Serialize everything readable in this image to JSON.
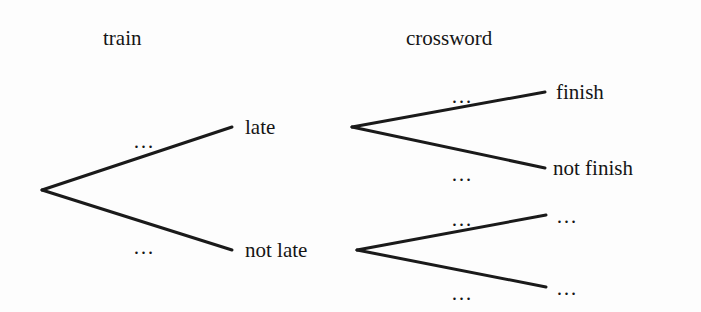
{
  "figure": {
    "kind": "probability-tree-diagram",
    "background_color": "#fdfdfd",
    "line_color": "#1a1a1a",
    "text_color": "#151515"
  },
  "columns": [
    {
      "id": "stage-1",
      "label": "train",
      "x": 103,
      "y": 28
    },
    {
      "id": "stage-2",
      "label": "crossword",
      "x": 406,
      "y": 28
    }
  ],
  "nodes": [
    {
      "id": "root",
      "label": "",
      "x": 42,
      "y": 190
    },
    {
      "id": "late",
      "label": "late",
      "x": 245,
      "y": 127
    },
    {
      "id": "not-late",
      "label": "not late",
      "x": 245,
      "y": 250
    },
    {
      "id": "finish",
      "label": "finish",
      "x": 556,
      "y": 92
    },
    {
      "id": "not-finish",
      "label": "not finish",
      "x": 553,
      "y": 168
    },
    {
      "id": "outcome-3",
      "label": "…",
      "x": 556,
      "y": 215
    },
    {
      "id": "outcome-4",
      "label": "…",
      "x": 556,
      "y": 287
    }
  ],
  "edges": [
    {
      "id": "root-to-late",
      "from": "root",
      "to": "late",
      "x1": 42,
      "y1": 190,
      "x2": 232,
      "y2": 127,
      "label": "…",
      "label_x": 133,
      "label_y": 131
    },
    {
      "id": "root-to-not-late",
      "from": "root",
      "to": "not-late",
      "x1": 42,
      "y1": 190,
      "x2": 232,
      "y2": 250,
      "label": "…",
      "label_x": 133,
      "label_y": 237
    },
    {
      "id": "late-to-finish",
      "from": "late",
      "to": "finish",
      "x1": 352,
      "y1": 127,
      "x2": 545,
      "y2": 92,
      "label": "…",
      "label_x": 451,
      "label_y": 86
    },
    {
      "id": "late-to-not-finish",
      "from": "late",
      "to": "not-finish",
      "x1": 352,
      "y1": 127,
      "x2": 545,
      "y2": 168,
      "label": "…",
      "label_x": 451,
      "label_y": 164
    },
    {
      "id": "not-late-to-outcome-3",
      "from": "not-late",
      "to": "outcome-3",
      "x1": 357,
      "y1": 250,
      "x2": 546,
      "y2": 215,
      "label": "…",
      "label_x": 451,
      "label_y": 209
    },
    {
      "id": "not-late-to-outcome-4",
      "from": "not-late",
      "to": "outcome-4",
      "x1": 357,
      "y1": 250,
      "x2": 546,
      "y2": 287,
      "label": "…",
      "label_x": 451,
      "label_y": 283
    }
  ],
  "chart_data": {
    "type": "tree",
    "title": "",
    "stages": [
      "train",
      "crossword"
    ],
    "levels": [
      {
        "stage": "train",
        "outcomes": [
          "late",
          "not late"
        ]
      },
      {
        "stage": "crossword",
        "outcomes": [
          "finish",
          "not finish",
          "…",
          "…"
        ]
      }
    ],
    "branch_probability_labels": [
      "…",
      "…",
      "…",
      "…",
      "…",
      "…"
    ]
  }
}
